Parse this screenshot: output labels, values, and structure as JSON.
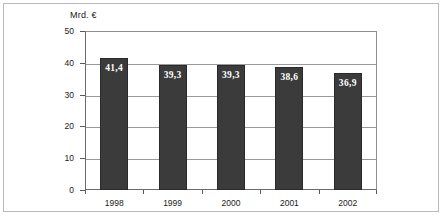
{
  "chart_data": {
    "type": "bar",
    "title": "",
    "subtitle": "",
    "xlabel": "",
    "ylabel": "Mrd. €",
    "categories": [
      "1998",
      "1999",
      "2000",
      "2001",
      "2002"
    ],
    "values": [
      41.4,
      39.3,
      39.3,
      38.6,
      36.9
    ],
    "value_labels": [
      "41,4",
      "39,3",
      "39,3",
      "38,6",
      "36,9"
    ],
    "ylim": [
      0,
      50
    ],
    "yticks": [
      0,
      10,
      20,
      30,
      40,
      50
    ],
    "ytick_labels": [
      "0",
      "10",
      "20",
      "30",
      "40",
      "50"
    ],
    "grid": true,
    "grid_axis": "y",
    "legend": false,
    "legend_position": "none",
    "bar_color": "#3b3b3b",
    "bar_edge_color": "#2a2a2a",
    "value_label_color": "#ffffff",
    "gridline_color": "#9a9a9a",
    "axis_color": "#6b6b6b",
    "frame_color": "#b9b9b9",
    "background_color": "#ffffff"
  }
}
